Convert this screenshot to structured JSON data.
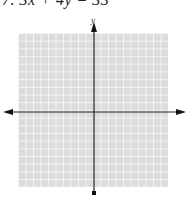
{
  "problem": {
    "number": "7.",
    "equation": "3x + 4y = 33",
    "full_text": "7.  3x + 4y = 33"
  },
  "graph": {
    "y_axis_label": "y",
    "x_axis_label": "",
    "grid_columns": 20,
    "grid_rows": 20,
    "grid_color": "#dcdcdc",
    "grid_line_color": "#f4f4f4",
    "axis_color": "#222222",
    "origin": {
      "x_px": 94,
      "y_px": 112
    }
  }
}
